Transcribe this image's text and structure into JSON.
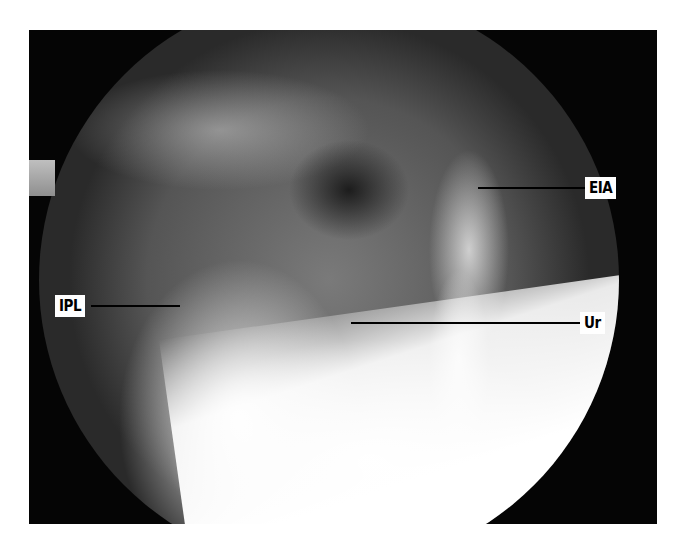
{
  "figure": {
    "labels": [
      {
        "id": "eia",
        "text": "EIA"
      },
      {
        "id": "ipl",
        "text": "IPL"
      },
      {
        "id": "ur",
        "text": "Ur"
      }
    ]
  }
}
